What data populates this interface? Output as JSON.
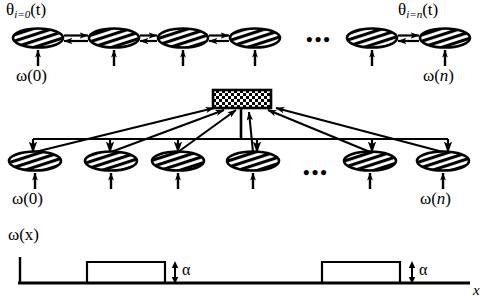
{
  "figure": {
    "title_top_left": "θ",
    "labels": {
      "theta_left_main": "θ",
      "theta_left_sub": "i=0",
      "theta_left_arg": "(t)",
      "theta_right_main": "θ",
      "theta_right_sub": "i=n",
      "theta_right_arg": "(t)",
      "omega_top_left": "ω(0)",
      "omega_top_right_pre": "ω(",
      "omega_top_right_it": "n",
      "omega_top_right_post": ")",
      "omega_mid_left": "ω(0)",
      "omega_mid_right_pre": "ω(",
      "omega_mid_right_it": "n",
      "omega_mid_right_post": ")",
      "omega_wave": "ω(x)",
      "alpha_1": "α",
      "alpha_2": "α",
      "axis_x": "x",
      "ellipsis_top": "•••",
      "ellipsis_mid": "•••"
    },
    "colors": {
      "ink": "#000000",
      "background": "#ffffff",
      "hatch": "#000000"
    },
    "rows": {
      "top_row": {
        "count_visible": 6,
        "node_shape": "ellipse-hatched",
        "connector": "double-headed-arrow",
        "input_arrow": "upward",
        "nodes_x": [
          38,
          114,
          183,
          255,
          372,
          445
        ],
        "gap_after_index": 3
      },
      "middle_row": {
        "count_visible": 6,
        "node_shape": "ellipse-hatched",
        "bus": "horizontal-broadcast-line",
        "fusion_box": "checkered-rectangle",
        "nodes_x": [
          35,
          111,
          178,
          253,
          370,
          443
        ],
        "gap_after_index": 3
      },
      "waveform": {
        "type": "square-pulse-train",
        "baseline_y": 283,
        "pulse_top_y": 262,
        "pulses": [
          {
            "x0": 87,
            "x1": 165
          },
          {
            "x0": 322,
            "x1": 400
          }
        ],
        "amplitude_label": "α",
        "axis_label": "x"
      }
    }
  }
}
